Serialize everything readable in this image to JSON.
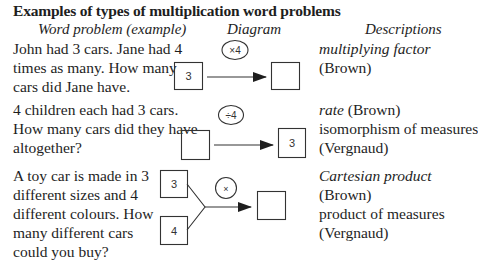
{
  "title": "Examples of types of multiplication word problems",
  "headers": {
    "word_problem": "Word problem (example)",
    "diagram": "Diagram",
    "descriptions": "Descriptions"
  },
  "rows": [
    {
      "problem_lines": [
        "John had 3 cars. Jane had 4",
        "times as many. How many",
        "cars did Jane have."
      ],
      "diagram": {
        "type": "multiplying",
        "left_box": "3",
        "operator": "×4",
        "right_box": ""
      },
      "description_lines": [
        {
          "text": "multiplying factor",
          "italic": true
        },
        {
          "text": "(Brown)",
          "italic": false
        }
      ]
    },
    {
      "problem_lines": [
        "4 children each had 3 cars.",
        "How many cars did they have",
        "altogether?"
      ],
      "diagram": {
        "type": "rate",
        "left_box": "",
        "operator": "÷4",
        "right_box": "3"
      },
      "description_lines": [
        {
          "text": "rate",
          "italic": true,
          "suffix": " (Brown)"
        },
        {
          "text": "isomorphism of measures",
          "italic": false
        },
        {
          "text": "(Vergnaud)",
          "italic": false
        }
      ]
    },
    {
      "problem_lines": [
        "A toy car is made in 3",
        "different sizes and 4",
        "different colours. How",
        "many different cars",
        "could you buy?"
      ],
      "diagram": {
        "type": "cartesian",
        "top_box": "3",
        "bottom_box": "4",
        "operator": "×",
        "right_box": ""
      },
      "description_lines": [
        {
          "text": "Cartesian product",
          "italic": true
        },
        {
          "text": "(Brown)",
          "italic": false
        },
        {
          "text": "product of measures",
          "italic": false
        },
        {
          "text": "(Vergnaud)",
          "italic": false
        }
      ]
    }
  ]
}
